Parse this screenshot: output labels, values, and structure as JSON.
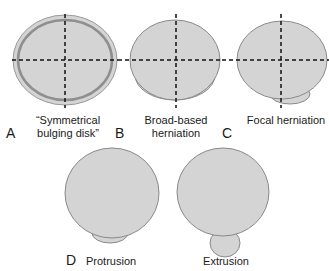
{
  "panels": {
    "A": {
      "letter": "A",
      "caption_line1": "“Symmetrical",
      "caption_line2": "bulging disk”"
    },
    "B": {
      "letter": "B",
      "caption_line1": "Broad-based",
      "caption_line2": "herniation"
    },
    "C": {
      "letter": "C",
      "caption_line1": "Focal herniation"
    },
    "D": {
      "letter": "D",
      "left_caption": "Protrusion",
      "right_caption": "Extrusion"
    }
  },
  "colors": {
    "disk_fill": "#d4d4d4",
    "disk_stroke": "#8a8a8a",
    "ring_stroke": "#9a9a9a",
    "dash": "#111111"
  }
}
